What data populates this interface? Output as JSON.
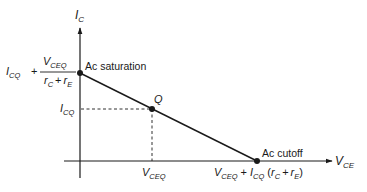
{
  "diagram": {
    "type": "ac-load-line",
    "axes": {
      "y_label": {
        "main": "I",
        "sub": "C"
      },
      "x_label": {
        "main": "V",
        "sub": "CE"
      }
    },
    "points": {
      "saturation": {
        "label": "Ac saturation",
        "y_value": {
          "prefix": {
            "main": "I",
            "sub": "CQ"
          },
          "plus": "+",
          "numerator": {
            "main": "V",
            "sub": "CEQ"
          },
          "denominator": {
            "r1": "r",
            "r1_sub": "C",
            "plus": "+",
            "r2": "r",
            "r2_sub": "E"
          }
        }
      },
      "q_point": {
        "label": "Q",
        "y_value": {
          "main": "I",
          "sub": "CQ"
        },
        "x_value": {
          "main": "V",
          "sub": "CEQ"
        }
      },
      "cutoff": {
        "label": "Ac cutoff",
        "x_value": {
          "v": "V",
          "v_sub": "CEQ",
          "plus1": "+",
          "i": "I",
          "i_sub": "CQ",
          "paren_open": "(",
          "r1": "r",
          "r1_sub": "C",
          "plus2": "+",
          "r2": "r",
          "r2_sub": "E",
          "paren_close": ")"
        }
      }
    },
    "colors": {
      "line": "#1a1a1a",
      "background": "#ffffff"
    }
  }
}
